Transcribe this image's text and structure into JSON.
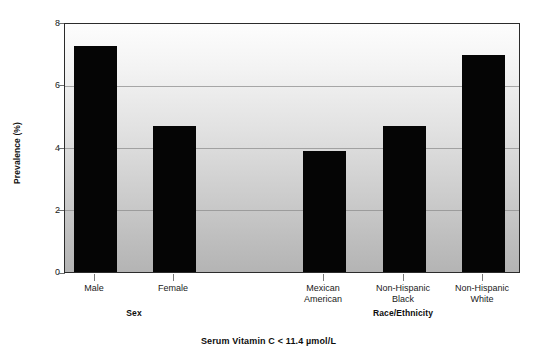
{
  "chart_data": {
    "type": "bar",
    "title": "Serum Vitamin C < 11.4 µmol/L",
    "xlabel": "",
    "ylabel": "Prevalence (%)",
    "ylim": [
      0,
      8
    ],
    "yticks": [
      0,
      2,
      4,
      6,
      8
    ],
    "ytick_labels": [
      "0",
      "2",
      "4",
      "6",
      "8"
    ],
    "grid": "horizontal",
    "legend": "none",
    "bar_color": "#050505",
    "categories": [
      "Male",
      "Female",
      "Mexican American",
      "Non-Hispanic Black",
      "Non-Hispanic White"
    ],
    "values": [
      7.3,
      4.7,
      3.9,
      4.7,
      7.0
    ],
    "groups": [
      {
        "label": "Sex",
        "categories": [
          "Male",
          "Female"
        ]
      },
      {
        "label": "Race/Ethnicity",
        "categories": [
          "Mexican American",
          "Non-Hispanic Black",
          "Non-Hispanic White"
        ]
      }
    ]
  },
  "axes": {
    "y_title": "Prevalence (%)",
    "y_tick_labels": [
      "8",
      "6",
      "4",
      "2",
      "0"
    ],
    "x_tick_labels": [
      {
        "line1": "Male",
        "line2": ""
      },
      {
        "line1": "Female",
        "line2": ""
      },
      {
        "line1": "Mexican",
        "line2": "American"
      },
      {
        "line1": "Non-Hispanic",
        "line2": "Black"
      },
      {
        "line1": "Non-Hispanic",
        "line2": "White"
      }
    ]
  },
  "group_labels": {
    "sex": "Sex",
    "race": "Race/Ethnicity"
  },
  "caption": "Serum Vitamin C < 11.4 µmol/L"
}
